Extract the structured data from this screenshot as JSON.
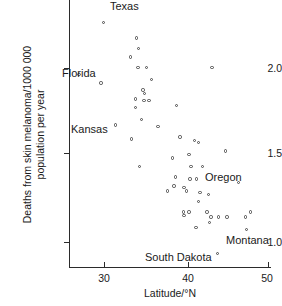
{
  "chart_data": {
    "type": "scatter",
    "title": "",
    "xlabel": "Latitude/°N",
    "ylabel_line1": "Deaths from skin melanoma/1000 000",
    "ylabel_line2": "population per year",
    "xlim": [
      24.5,
      50.5
    ],
    "ylim": [
      0.88,
      2.28
    ],
    "xticks": [
      30,
      40,
      50
    ],
    "xtick_labels": [
      "30",
      "40",
      "50"
    ],
    "yticks": [
      1.0,
      1.5,
      2.0
    ],
    "ytick_labels": [
      "1.0",
      "1.5",
      "2.0"
    ],
    "grid": false,
    "legend": false,
    "marker": "open-circle",
    "marker_color": "#4a4a4a",
    "points": [
      {
        "x": 30.0,
        "y": 2.26,
        "label": "Texas"
      },
      {
        "x": 27.1,
        "y": 1.96,
        "label": "Florida"
      },
      {
        "x": 29.7,
        "y": 1.91,
        "label": null
      },
      {
        "x": 33.9,
        "y": 2.17,
        "label": null
      },
      {
        "x": 34.2,
        "y": 2.11,
        "label": null
      },
      {
        "x": 33.2,
        "y": 2.06,
        "label": null
      },
      {
        "x": 34.1,
        "y": 2.0,
        "label": null
      },
      {
        "x": 35.1,
        "y": 2.0,
        "label": null
      },
      {
        "x": 35.7,
        "y": 1.93,
        "label": null
      },
      {
        "x": 34.7,
        "y": 1.87,
        "label": null
      },
      {
        "x": 34.9,
        "y": 1.85,
        "label": null
      },
      {
        "x": 33.8,
        "y": 1.82,
        "label": null
      },
      {
        "x": 34.8,
        "y": 1.81,
        "label": null
      },
      {
        "x": 35.4,
        "y": 1.81,
        "label": null
      },
      {
        "x": 33.8,
        "y": 1.77,
        "label": null
      },
      {
        "x": 34.5,
        "y": 1.7,
        "label": null
      },
      {
        "x": 31.4,
        "y": 1.67,
        "label": "Kansas"
      },
      {
        "x": 36.5,
        "y": 1.66,
        "label": null
      },
      {
        "x": 33.3,
        "y": 1.59,
        "label": null
      },
      {
        "x": 34.3,
        "y": 1.43,
        "label": null
      },
      {
        "x": 42.9,
        "y": 2.0,
        "label": null
      },
      {
        "x": 38.7,
        "y": 1.78,
        "label": null
      },
      {
        "x": 39.1,
        "y": 1.6,
        "label": null
      },
      {
        "x": 40.8,
        "y": 1.58,
        "label": null
      },
      {
        "x": 41.3,
        "y": 1.57,
        "label": null
      },
      {
        "x": 40.2,
        "y": 1.5,
        "label": null
      },
      {
        "x": 44.5,
        "y": 1.52,
        "label": null
      },
      {
        "x": 38.2,
        "y": 1.48,
        "label": null
      },
      {
        "x": 40.4,
        "y": 1.43,
        "label": null
      },
      {
        "x": 41.8,
        "y": 1.43,
        "label": null
      },
      {
        "x": 38.6,
        "y": 1.37,
        "label": null
      },
      {
        "x": 40.3,
        "y": 1.36,
        "label": null
      },
      {
        "x": 41.1,
        "y": 1.36,
        "label": null
      },
      {
        "x": 46.1,
        "y": 1.34,
        "label": "Oregon"
      },
      {
        "x": 38.4,
        "y": 1.32,
        "label": null
      },
      {
        "x": 39.6,
        "y": 1.31,
        "label": null
      },
      {
        "x": 39.9,
        "y": 1.29,
        "label": null
      },
      {
        "x": 37.6,
        "y": 1.29,
        "label": null
      },
      {
        "x": 41.5,
        "y": 1.28,
        "label": null
      },
      {
        "x": 42.5,
        "y": 1.27,
        "label": null
      },
      {
        "x": 41.3,
        "y": 1.23,
        "label": null
      },
      {
        "x": 39.5,
        "y": 1.17,
        "label": null
      },
      {
        "x": 40.2,
        "y": 1.17,
        "label": null
      },
      {
        "x": 42.3,
        "y": 1.17,
        "label": null
      },
      {
        "x": 47.5,
        "y": 1.17,
        "label": null
      },
      {
        "x": 39.6,
        "y": 1.15,
        "label": null
      },
      {
        "x": 42.8,
        "y": 1.14,
        "label": null
      },
      {
        "x": 43.7,
        "y": 1.14,
        "label": null
      },
      {
        "x": 44.7,
        "y": 1.14,
        "label": null
      },
      {
        "x": 46.9,
        "y": 1.14,
        "label": null
      },
      {
        "x": 41.0,
        "y": 1.08,
        "label": null
      },
      {
        "x": 42.6,
        "y": 1.11,
        "label": null
      },
      {
        "x": 47.0,
        "y": 1.07,
        "label": "Montana"
      },
      {
        "x": 43.6,
        "y": 0.93,
        "label": "South Dakota"
      }
    ],
    "annotations": [
      {
        "text": "Texas",
        "x": 30.0,
        "y": 2.26,
        "position": "right"
      },
      {
        "text": "Florida",
        "x": 27.1,
        "y": 1.96,
        "position": "above-left"
      },
      {
        "text": "Kansas",
        "x": 31.4,
        "y": 1.67,
        "position": "left"
      },
      {
        "text": "Oregon",
        "x": 46.1,
        "y": 1.34,
        "position": "above"
      },
      {
        "text": "Montana",
        "x": 47.0,
        "y": 1.07,
        "position": "below-left"
      },
      {
        "text": "South Dakota",
        "x": 43.6,
        "y": 0.93,
        "position": "left"
      }
    ]
  },
  "axes": {
    "x_title": "Latitude/°N",
    "y_title_line1": "Deaths from skin melanoma/1000 000",
    "y_title_line2": "population per year",
    "x_tick_labels": [
      "30",
      "40",
      "50"
    ],
    "y_tick_labels": [
      "2.0",
      "1.5",
      "1.0"
    ]
  },
  "annotation_labels": {
    "texas": "Texas",
    "florida": "Florida",
    "kansas": "Kansas",
    "oregon": "Oregon",
    "montana": "Montana",
    "south_dakota": "South Dakota"
  },
  "colors": {
    "axis": "#2b2b2b",
    "marker": "#4a4a4a",
    "text": "#1a1a1a",
    "background": "#ffffff"
  }
}
